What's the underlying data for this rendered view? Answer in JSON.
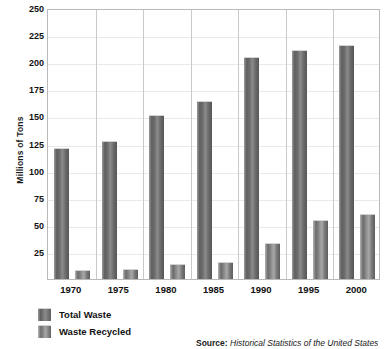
{
  "chart_data": {
    "type": "bar",
    "title": "",
    "xlabel": "",
    "ylabel": "Millions of Tons",
    "categories": [
      "1970",
      "1975",
      "1980",
      "1985",
      "1990",
      "1995",
      "2000"
    ],
    "series": [
      {
        "name": "Total Waste",
        "values": [
          121,
          127,
          151,
          164,
          205,
          211,
          216
        ]
      },
      {
        "name": "Waste Recycled",
        "values": [
          8,
          9.5,
          14,
          16,
          33,
          54,
          60
        ]
      }
    ],
    "ylim": [
      0,
      250
    ],
    "yticks": [
      25,
      50,
      75,
      100,
      125,
      150,
      175,
      200,
      225,
      250
    ],
    "ytick_labels": [
      "25",
      "50",
      "75",
      "100",
      "125",
      "150",
      "175",
      "200",
      "225",
      "250"
    ],
    "grid": true,
    "legend_position": "bottom-left",
    "bar_color": "#6d6d6d",
    "gridline_color": "#e9e9e9",
    "frame_color": "#b9b9b9"
  },
  "axis": {
    "y_title": "Millions of Tons"
  },
  "legend": {
    "items": [
      {
        "label": "Total Waste",
        "swatch": "total"
      },
      {
        "label": "Waste Recycled",
        "swatch": "recycled"
      }
    ]
  },
  "source": {
    "prefix": "Source:",
    "text": "Historical Statistics of the United States"
  }
}
